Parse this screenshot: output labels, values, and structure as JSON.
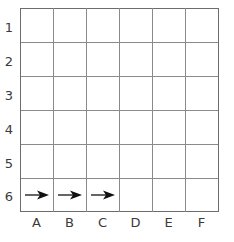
{
  "figure": {
    "kind": "coordinate-grid-worksheet"
  },
  "grid": {
    "columns": 6,
    "rows": 6,
    "line_color": "#8a8a8a",
    "border_color": "#6d6d6d",
    "background": "#ffffff",
    "cell_width": 33,
    "cell_height": 34,
    "origin_x": 20,
    "origin_y": 8
  },
  "row_labels": [
    {
      "text": "1",
      "index": 0
    },
    {
      "text": "2",
      "index": 1
    },
    {
      "text": "3",
      "index": 2
    },
    {
      "text": "4",
      "index": 3
    },
    {
      "text": "5",
      "index": 4
    },
    {
      "text": "6",
      "index": 5
    }
  ],
  "column_labels": [
    {
      "text": "A",
      "index": 0
    },
    {
      "text": "B",
      "index": 1
    },
    {
      "text": "C",
      "index": 2
    },
    {
      "text": "D",
      "index": 3
    },
    {
      "text": "E",
      "index": 4
    },
    {
      "text": "F",
      "index": 5
    }
  ],
  "markers": {
    "icon": "arrow-right-icon",
    "color": "#111111",
    "cells": [
      {
        "column": "A",
        "row": "6",
        "col_index": 0,
        "row_index": 5
      },
      {
        "column": "B",
        "row": "6",
        "col_index": 1,
        "row_index": 5
      },
      {
        "column": "C",
        "row": "6",
        "col_index": 2,
        "row_index": 5
      }
    ]
  }
}
